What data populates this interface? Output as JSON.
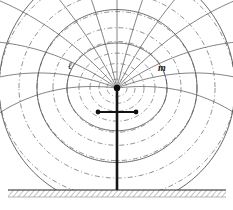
{
  "figure": {
    "background_color": "#ffffff",
    "ink_color": "#4a4a4a",
    "dark_ink_color": "#111111",
    "width": 233,
    "height": 210
  },
  "labels": {
    "left": {
      "text": "ℓ",
      "x": 68,
      "y": 69
    },
    "right": {
      "text": "m",
      "x": 158,
      "y": 71
    }
  },
  "source": {
    "center_x": 117,
    "center_y": 88,
    "radius": 3.2
  },
  "mast": {
    "x": 117,
    "top_y": 88,
    "bottom_y": 190,
    "width": 2.6
  },
  "gap_marker": {
    "y": 112,
    "x_left": 98,
    "x_right": 136,
    "dot_radius": 2.4
  },
  "ground": {
    "y": 190,
    "x_start": 8,
    "x_end": 226,
    "hatch_depth": 7,
    "hatch_spacing": 3.2
  },
  "chart_data": {
    "type": "line",
    "xlabel": "",
    "ylabel": "",
    "legend": [
      "ℓ  (electric field / radial lines, solid)",
      "m  (equipotential / magnetic lines, dash-dot arcs)"
    ],
    "series": [
      {
        "name": "radial-field-lines",
        "style": "solid",
        "count": 13,
        "angles_deg": [
          -84,
          -70,
          -56,
          -42,
          -28,
          -14,
          0,
          14,
          28,
          42,
          56,
          70,
          84
        ]
      },
      {
        "name": "equipotential-arcs",
        "style": "dash-dot",
        "count": 9,
        "radii": [
          10,
          18,
          27,
          38,
          50,
          64,
          80,
          98,
          118
        ]
      },
      {
        "name": "outer-boundary-arcs",
        "style": "solid",
        "count": 3,
        "radii": [
          50,
          80,
          118
        ]
      }
    ]
  }
}
